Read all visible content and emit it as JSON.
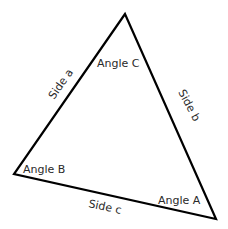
{
  "diagram": {
    "type": "triangle",
    "vertices": {
      "C": {
        "x": 125,
        "y": 14
      },
      "B": {
        "x": 14,
        "y": 174
      },
      "A": {
        "x": 216,
        "y": 219
      }
    },
    "stroke_color": "#000000",
    "angles": [
      {
        "id": "angle-c",
        "label": "Angle C"
      },
      {
        "id": "angle-b",
        "label": "Angle B"
      },
      {
        "id": "angle-a",
        "label": "Angle A"
      }
    ],
    "sides": [
      {
        "id": "side-a",
        "label": "Side a"
      },
      {
        "id": "side-b",
        "label": "Side b"
      },
      {
        "id": "side-c",
        "label": "Side c"
      }
    ]
  }
}
